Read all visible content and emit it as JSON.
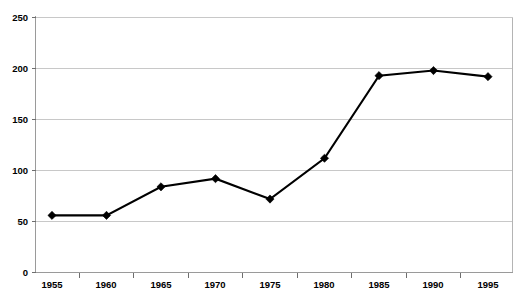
{
  "chart_data": {
    "type": "line",
    "title": "",
    "subtitle": "",
    "xlabel": "",
    "ylabel": "",
    "categories": [
      "1955",
      "1960",
      "1965",
      "1970",
      "1975",
      "1980",
      "1985",
      "1990",
      "1995"
    ],
    "x": [
      1955,
      1960,
      1965,
      1970,
      1975,
      1980,
      1985,
      1990,
      1995
    ],
    "series": [
      {
        "name": "",
        "values": [
          56,
          56,
          84,
          92,
          72,
          112,
          193,
          198,
          192
        ]
      }
    ],
    "values": [
      56,
      56,
      84,
      92,
      72,
      112,
      193,
      198,
      192
    ],
    "ylim": [
      0,
      250
    ],
    "yticks": [
      0,
      50,
      100,
      150,
      200,
      250
    ],
    "ytick_labels": [
      "0",
      "50",
      "100",
      "150",
      "200",
      "250"
    ],
    "xtick_labels": [
      "1955",
      "1960",
      "1965",
      "1970",
      "1975",
      "1980",
      "1985",
      "1990",
      "1995"
    ],
    "grid": true,
    "grid_axis": "y",
    "legend": false,
    "legend_position": "none",
    "marker": "diamond",
    "line_color": "#000000",
    "marker_color": "#000000",
    "grid_color": "#c8c8c8",
    "plot_background": "#ffffff",
    "annotations": []
  },
  "figure": {
    "title_clipped": "",
    "caption_clipped": ""
  }
}
